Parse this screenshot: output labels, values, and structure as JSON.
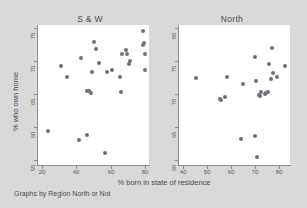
{
  "figure": {
    "background_color": "#d9d9d9",
    "plot_background_color": "#ffffff",
    "marker_color": "#6f6f7b",
    "axis_color": "#8a8a92",
    "text_color": "#4a4a52",
    "xtitle": "% born in state of residence",
    "ytitle": "% who own home",
    "note": "Graphs by Region North or Not"
  },
  "chart_data": [
    {
      "type": "scatter",
      "title": "S & W",
      "xlabel": "% born in state of residence",
      "ylabel": "% who own home",
      "xlim": [
        18,
        82
      ],
      "ylim": [
        54,
        76
      ],
      "xticks": [
        20,
        40,
        60,
        80
      ],
      "yticks": [
        55,
        60,
        65,
        70,
        75
      ],
      "grid": false,
      "legend": "none",
      "points": [
        {
          "x": 24.0,
          "y": 59.3
        },
        {
          "x": 31.0,
          "y": 69.6
        },
        {
          "x": 35.0,
          "y": 67.8
        },
        {
          "x": 41.5,
          "y": 58.0
        },
        {
          "x": 43.0,
          "y": 70.8
        },
        {
          "x": 46.0,
          "y": 58.7
        },
        {
          "x": 46.5,
          "y": 65.6
        },
        {
          "x": 47.5,
          "y": 65.7
        },
        {
          "x": 48.5,
          "y": 65.3
        },
        {
          "x": 49.0,
          "y": 68.6
        },
        {
          "x": 50.5,
          "y": 73.4
        },
        {
          "x": 51.5,
          "y": 72.3
        },
        {
          "x": 53.0,
          "y": 70.0
        },
        {
          "x": 56.5,
          "y": 55.9
        },
        {
          "x": 57.5,
          "y": 68.6
        },
        {
          "x": 60.5,
          "y": 69.0
        },
        {
          "x": 65.5,
          "y": 67.8
        },
        {
          "x": 66.0,
          "y": 65.5
        },
        {
          "x": 66.5,
          "y": 71.4
        },
        {
          "x": 68.5,
          "y": 72.0
        },
        {
          "x": 69.5,
          "y": 71.5
        },
        {
          "x": 70.5,
          "y": 69.9
        },
        {
          "x": 71.0,
          "y": 70.4
        },
        {
          "x": 78.5,
          "y": 75.1
        },
        {
          "x": 78.5,
          "y": 72.9
        },
        {
          "x": 79.0,
          "y": 73.1
        },
        {
          "x": 79.5,
          "y": 71.4
        },
        {
          "x": 79.5,
          "y": 68.9
        }
      ]
    },
    {
      "type": "scatter",
      "title": "North",
      "xlabel": "% born in state of residence",
      "ylabel": "% who own home",
      "xlim": [
        38,
        84
      ],
      "ylim": [
        59,
        81
      ],
      "xticks": [
        40,
        50,
        60,
        70,
        80
      ],
      "yticks": [
        60,
        65,
        70,
        75,
        80
      ],
      "grid": false,
      "legend": "none",
      "points": [
        {
          "x": 45.0,
          "y": 72.7
        },
        {
          "x": 55.0,
          "y": 69.4
        },
        {
          "x": 55.5,
          "y": 69.2
        },
        {
          "x": 57.0,
          "y": 69.7
        },
        {
          "x": 58.0,
          "y": 72.9
        },
        {
          "x": 63.5,
          "y": 63.1
        },
        {
          "x": 64.5,
          "y": 71.8
        },
        {
          "x": 69.5,
          "y": 63.6
        },
        {
          "x": 69.5,
          "y": 76.0
        },
        {
          "x": 70.0,
          "y": 72.2
        },
        {
          "x": 70.5,
          "y": 60.2
        },
        {
          "x": 71.0,
          "y": 70.0
        },
        {
          "x": 71.5,
          "y": 69.8
        },
        {
          "x": 72.0,
          "y": 70.4
        },
        {
          "x": 73.5,
          "y": 70.2
        },
        {
          "x": 74.0,
          "y": 70.3
        },
        {
          "x": 75.0,
          "y": 70.5
        },
        {
          "x": 75.5,
          "y": 74.9
        },
        {
          "x": 76.0,
          "y": 72.5
        },
        {
          "x": 76.5,
          "y": 77.4
        },
        {
          "x": 77.0,
          "y": 73.4
        },
        {
          "x": 78.5,
          "y": 72.9
        },
        {
          "x": 82.0,
          "y": 74.6
        }
      ]
    }
  ],
  "panels": [
    {
      "title": "S & W",
      "ytick_labels": [
        "75",
        "70",
        "65",
        "60",
        "55"
      ],
      "xtick_labels": [
        "20",
        "40",
        "60",
        "80"
      ]
    },
    {
      "title": "North",
      "ytick_labels": [
        "80",
        "75",
        "70",
        "65",
        "60"
      ],
      "xtick_labels": [
        "40",
        "50",
        "60",
        "70",
        "80"
      ]
    }
  ]
}
